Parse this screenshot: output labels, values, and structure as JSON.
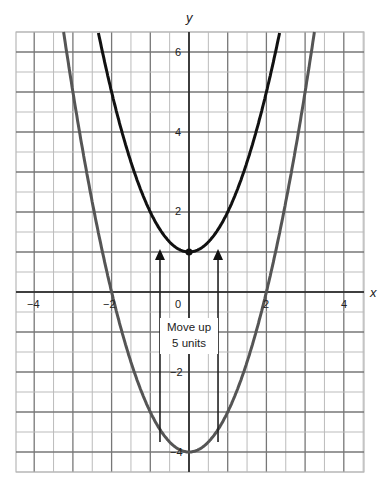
{
  "chart_data": {
    "type": "line",
    "title": "",
    "xlabel": "x",
    "ylabel": "y",
    "xlim": [
      -4.5,
      4.5
    ],
    "ylim": [
      -4.5,
      6.5
    ],
    "grid": true,
    "x_ticks": [
      "-4",
      "-2",
      "0",
      "2",
      "4"
    ],
    "y_ticks": [
      "6",
      "4",
      "2",
      "-2",
      "-4"
    ],
    "series": [
      {
        "name": "y = x^2 + 1",
        "formula": "x^2 + 1",
        "color": "#111111",
        "vertex": [
          0,
          1
        ]
      },
      {
        "name": "y = x^2 - 4",
        "formula": "x^2 - 4",
        "color": "#555555",
        "vertex": [
          0,
          -4
        ],
        "x_intercepts": [
          -2,
          2
        ]
      }
    ],
    "annotations": [
      {
        "text_line1": "Move up",
        "text_line2": "5 units",
        "type": "arrows-up",
        "arrow_x": [
          -0.75,
          0.75
        ]
      }
    ]
  },
  "labels": {
    "x_axis": "x",
    "y_axis": "y",
    "origin": "0",
    "xt_m4": "−4",
    "xt_m2": "−2",
    "xt_2": "2",
    "xt_4": "4",
    "yt_6": "6",
    "yt_4": "4",
    "yt_2": "2",
    "yt_m2": "−2",
    "yt_m4": "−4",
    "note_line1": "Move up",
    "note_line2": "5 units"
  }
}
